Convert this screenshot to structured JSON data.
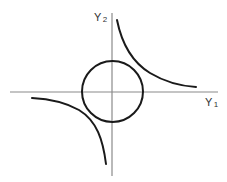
{
  "diagram": {
    "type": "phase-plane sketch",
    "axes": {
      "horizontal": {
        "label_base": "Y",
        "label_sub": "1"
      },
      "vertical": {
        "label_base": "Y",
        "label_sub": "2"
      }
    },
    "curves": [
      {
        "name": "circle",
        "shape": "circle centered at origin"
      },
      {
        "name": "hyperbola-branch-upper-right",
        "quadrant": "I"
      },
      {
        "name": "hyperbola-branch-lower-left",
        "quadrant": "III"
      }
    ],
    "colors": {
      "axis": "#8a8a8a",
      "curve": "#1a1a1a",
      "label": "#333333",
      "background": "#ffffff"
    }
  }
}
